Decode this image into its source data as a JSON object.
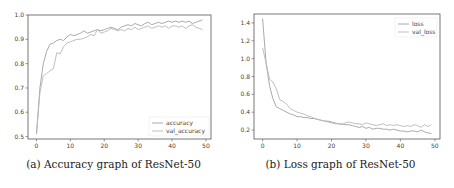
{
  "chart_data": [
    {
      "type": "line",
      "title": "",
      "caption": "(a) Accuracy graph of ResNet-50",
      "xlabel": "",
      "ylabel": "",
      "xlim": [
        -2.5,
        51.5
      ],
      "ylim": [
        0.49,
        1.0
      ],
      "xticks": [
        0,
        10,
        20,
        30,
        40,
        50
      ],
      "yticks": [
        0.5,
        0.6,
        0.7,
        0.8,
        0.9,
        1.0
      ],
      "grid": false,
      "legend_position": "lower right",
      "x": [
        0,
        1,
        2,
        3,
        4,
        5,
        6,
        7,
        8,
        9,
        10,
        11,
        12,
        13,
        14,
        15,
        16,
        17,
        18,
        19,
        20,
        21,
        22,
        23,
        24,
        25,
        26,
        27,
        28,
        29,
        30,
        31,
        32,
        33,
        34,
        35,
        36,
        37,
        38,
        39,
        40,
        41,
        42,
        43,
        44,
        45,
        46,
        47,
        48,
        49
      ],
      "series": [
        {
          "name": "accuracy",
          "color": "#a0a0a0",
          "values": [
            0.51,
            0.7,
            0.8,
            0.85,
            0.88,
            0.885,
            0.895,
            0.9,
            0.895,
            0.91,
            0.92,
            0.915,
            0.92,
            0.925,
            0.935,
            0.925,
            0.93,
            0.935,
            0.94,
            0.935,
            0.94,
            0.945,
            0.95,
            0.945,
            0.94,
            0.95,
            0.955,
            0.96,
            0.955,
            0.965,
            0.96,
            0.955,
            0.965,
            0.97,
            0.96,
            0.965,
            0.97,
            0.965,
            0.97,
            0.975,
            0.97,
            0.975,
            0.97,
            0.975,
            0.97,
            0.975,
            0.965,
            0.97,
            0.975,
            0.98
          ]
        },
        {
          "name": "val_accuracy",
          "color": "#b8b8b8",
          "values": [
            0.51,
            0.68,
            0.75,
            0.76,
            0.77,
            0.78,
            0.845,
            0.84,
            0.87,
            0.885,
            0.89,
            0.895,
            0.9,
            0.9,
            0.905,
            0.91,
            0.92,
            0.915,
            0.94,
            0.925,
            0.93,
            0.935,
            0.945,
            0.94,
            0.935,
            0.94,
            0.935,
            0.945,
            0.94,
            0.95,
            0.94,
            0.945,
            0.95,
            0.955,
            0.945,
            0.95,
            0.955,
            0.95,
            0.955,
            0.945,
            0.955,
            0.955,
            0.95,
            0.955,
            0.945,
            0.955,
            0.96,
            0.95,
            0.945,
            0.94
          ]
        }
      ]
    },
    {
      "type": "line",
      "title": "",
      "caption": "(b) Loss graph of ResNet-50",
      "xlabel": "",
      "ylabel": "",
      "xlim": [
        -2.5,
        51.5
      ],
      "ylim": [
        0.1,
        1.5
      ],
      "xticks": [
        0,
        10,
        20,
        30,
        40,
        50
      ],
      "yticks": [
        0.2,
        0.4,
        0.6,
        0.8,
        1.0,
        1.2,
        1.4
      ],
      "grid": false,
      "legend_position": "upper right",
      "x": [
        0,
        1,
        2,
        3,
        4,
        5,
        6,
        7,
        8,
        9,
        10,
        11,
        12,
        13,
        14,
        15,
        16,
        17,
        18,
        19,
        20,
        21,
        22,
        23,
        24,
        25,
        26,
        27,
        28,
        29,
        30,
        31,
        32,
        33,
        34,
        35,
        36,
        37,
        38,
        39,
        40,
        41,
        42,
        43,
        44,
        45,
        46,
        47,
        48,
        49
      ],
      "series": [
        {
          "name": "loss",
          "color": "#a0a0a0",
          "values": [
            1.45,
            0.95,
            0.7,
            0.55,
            0.46,
            0.44,
            0.42,
            0.4,
            0.38,
            0.37,
            0.35,
            0.35,
            0.34,
            0.34,
            0.33,
            0.33,
            0.32,
            0.31,
            0.3,
            0.3,
            0.29,
            0.28,
            0.27,
            0.27,
            0.26,
            0.26,
            0.25,
            0.24,
            0.23,
            0.24,
            0.22,
            0.23,
            0.21,
            0.22,
            0.22,
            0.21,
            0.21,
            0.2,
            0.21,
            0.2,
            0.19,
            0.19,
            0.18,
            0.19,
            0.19,
            0.18,
            0.2,
            0.18,
            0.17,
            0.16
          ]
        },
        {
          "name": "val_loss",
          "color": "#b8b8b8",
          "values": [
            1.12,
            0.95,
            0.77,
            0.74,
            0.66,
            0.54,
            0.52,
            0.49,
            0.44,
            0.42,
            0.4,
            0.39,
            0.38,
            0.36,
            0.35,
            0.33,
            0.32,
            0.31,
            0.3,
            0.29,
            0.28,
            0.27,
            0.27,
            0.26,
            0.28,
            0.29,
            0.28,
            0.27,
            0.27,
            0.26,
            0.28,
            0.27,
            0.26,
            0.25,
            0.26,
            0.27,
            0.25,
            0.26,
            0.25,
            0.26,
            0.25,
            0.24,
            0.25,
            0.24,
            0.26,
            0.25,
            0.23,
            0.26,
            0.24,
            0.26
          ]
        }
      ]
    }
  ],
  "captions": {
    "a": "(a) Accuracy graph of ResNet-50",
    "b": "(b) Loss graph of ResNet-50"
  }
}
